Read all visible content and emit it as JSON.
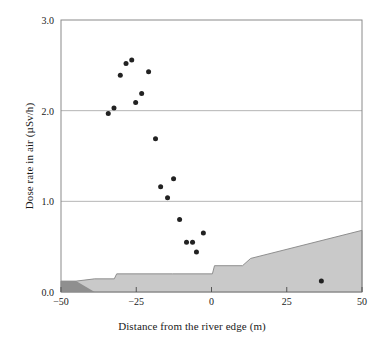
{
  "chart_data": {
    "type": "scatter",
    "title": "",
    "xlabel": "Distance from the river edge (m)",
    "ylabel": "Dose rate in air (µSv/h)",
    "xlim": [
      -50,
      50
    ],
    "ylim": [
      0.0,
      3.0
    ],
    "xticks": [
      -50,
      -25,
      0,
      25,
      50
    ],
    "xtick_labels": [
      "−50",
      "−25",
      "0",
      "25",
      "50"
    ],
    "yticks": [
      0.0,
      1.0,
      2.0,
      3.0
    ],
    "ytick_labels": [
      "0.0",
      "1.0",
      "2.0",
      "3.0"
    ],
    "grid": "horizontal",
    "gridlines_y": [
      1.0,
      2.0
    ],
    "legend": "none",
    "marker": {
      "shape": "circle",
      "color": "#222222",
      "size": 4
    },
    "series": [
      {
        "name": "Dose rate measurements",
        "points": [
          {
            "x": -34.3,
            "y": 1.97
          },
          {
            "x": -32.4,
            "y": 2.03
          },
          {
            "x": -30.3,
            "y": 2.39
          },
          {
            "x": -28.4,
            "y": 2.52
          },
          {
            "x": -26.5,
            "y": 2.56
          },
          {
            "x": -25.2,
            "y": 2.09
          },
          {
            "x": -23.2,
            "y": 2.19
          },
          {
            "x": -20.9,
            "y": 2.43
          },
          {
            "x": -18.6,
            "y": 1.69
          },
          {
            "x": -16.9,
            "y": 1.16
          },
          {
            "x": -14.6,
            "y": 1.04
          },
          {
            "x": -12.6,
            "y": 1.25
          },
          {
            "x": -10.6,
            "y": 0.8
          },
          {
            "x": -8.3,
            "y": 0.55
          },
          {
            "x": -6.3,
            "y": 0.55
          },
          {
            "x": -5.0,
            "y": 0.44
          },
          {
            "x": -2.7,
            "y": 0.65
          },
          {
            "x": 36.5,
            "y": 0.12
          }
        ]
      }
    ],
    "terrain": {
      "name": "Ground surface profile",
      "fill_color": "#c9c9c9",
      "edge_color": "#8f8f8f",
      "profile": [
        {
          "x": -50.0,
          "y": 0.0
        },
        {
          "x": -50.0,
          "y": 0.12
        },
        {
          "x": -45.0,
          "y": 0.12
        },
        {
          "x": -38.8,
          "y": 0.145
        },
        {
          "x": -32.3,
          "y": 0.145
        },
        {
          "x": -31.5,
          "y": 0.2
        },
        {
          "x": -13.0,
          "y": 0.2
        },
        {
          "x": 0.3,
          "y": 0.2
        },
        {
          "x": 1.0,
          "y": 0.29
        },
        {
          "x": 10.3,
          "y": 0.29
        },
        {
          "x": 13.0,
          "y": 0.37
        },
        {
          "x": 50.0,
          "y": 0.68
        },
        {
          "x": 50.0,
          "y": 0.0
        }
      ]
    },
    "river": {
      "name": "River water wedge",
      "fill_color": "#8f8f8f",
      "profile": [
        {
          "x": -50.0,
          "y": 0.0
        },
        {
          "x": -50.0,
          "y": 0.12
        },
        {
          "x": -45.0,
          "y": 0.12
        },
        {
          "x": -38.8,
          "y": 0.0
        }
      ]
    }
  },
  "axes": {
    "frame_color": "#8a8a8a",
    "grid_color": "#b5b5b5"
  }
}
